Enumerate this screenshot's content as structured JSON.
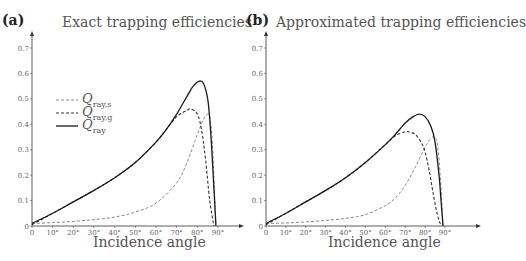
{
  "chart_data": [
    {
      "type": "line",
      "panel_label": "(a)",
      "title": "Exact trapping efficiencies",
      "xlabel": "Incidence angle",
      "ylabel": "",
      "xlim": [
        0,
        90
      ],
      "ylim": [
        0,
        0.7
      ],
      "x_ticks": [
        "0",
        "10°",
        "20°",
        "30°",
        "40°",
        "50°",
        "60°",
        "70°",
        "80°",
        "90°"
      ],
      "y_ticks": [
        "0",
        "0.1",
        "0.2",
        "0.3",
        "0.4",
        "0.5",
        "0.6",
        "0.7"
      ],
      "grid": false,
      "legend_position": "upper-left",
      "series": [
        {
          "name": "Q_ray,s",
          "style": "dashed-light",
          "x": [
            0,
            10,
            20,
            30,
            40,
            50,
            60,
            70,
            75,
            80,
            83,
            85,
            86,
            87,
            88,
            89
          ],
          "y": [
            0.01,
            0.013,
            0.018,
            0.025,
            0.035,
            0.055,
            0.09,
            0.17,
            0.25,
            0.36,
            0.42,
            0.44,
            0.43,
            0.36,
            0.2,
            0.0
          ]
        },
        {
          "name": "Q_ray,g",
          "style": "dashed-dark",
          "x": [
            0,
            10,
            20,
            30,
            40,
            50,
            60,
            65,
            70,
            75,
            77,
            80,
            82,
            84,
            86,
            88
          ],
          "y": [
            0.005,
            0.05,
            0.095,
            0.14,
            0.19,
            0.25,
            0.33,
            0.38,
            0.43,
            0.455,
            0.46,
            0.44,
            0.38,
            0.26,
            0.1,
            0.0
          ]
        },
        {
          "name": "Q_ray",
          "style": "solid",
          "x": [
            0,
            10,
            20,
            30,
            40,
            50,
            60,
            65,
            70,
            75,
            78,
            81,
            83,
            85,
            86,
            87,
            88,
            89
          ],
          "y": [
            0.01,
            0.05,
            0.095,
            0.14,
            0.19,
            0.25,
            0.33,
            0.38,
            0.44,
            0.51,
            0.55,
            0.57,
            0.56,
            0.5,
            0.42,
            0.3,
            0.15,
            0.0
          ]
        }
      ]
    },
    {
      "type": "line",
      "panel_label": "(b)",
      "title": "Approximated trapping efficiencies",
      "xlabel": "Incidence angle",
      "ylabel": "",
      "xlim": [
        0,
        90
      ],
      "ylim": [
        0,
        0.7
      ],
      "x_ticks": [
        "0",
        "10°",
        "20°",
        "30°",
        "40°",
        "50°",
        "60°",
        "70°",
        "80°",
        "90°"
      ],
      "y_ticks": [
        "0",
        "0.1",
        "0.2",
        "0.3",
        "0.4",
        "0.5",
        "0.6",
        "0.7"
      ],
      "grid": false,
      "series": [
        {
          "name": "Q_ray,s",
          "style": "dashed-light",
          "x": [
            0,
            10,
            20,
            30,
            40,
            50,
            60,
            65,
            70,
            75,
            80,
            83,
            85,
            86,
            87,
            88,
            89
          ],
          "y": [
            0.01,
            0.012,
            0.016,
            0.022,
            0.03,
            0.045,
            0.08,
            0.11,
            0.16,
            0.23,
            0.31,
            0.345,
            0.35,
            0.33,
            0.26,
            0.15,
            0.0
          ]
        },
        {
          "name": "Q_ray,g",
          "style": "dashed-dark",
          "x": [
            0,
            10,
            20,
            30,
            40,
            50,
            60,
            65,
            70,
            72,
            75,
            78,
            80,
            82,
            84,
            86,
            88
          ],
          "y": [
            0.005,
            0.05,
            0.095,
            0.14,
            0.19,
            0.25,
            0.32,
            0.355,
            0.37,
            0.37,
            0.36,
            0.33,
            0.29,
            0.22,
            0.13,
            0.05,
            0.0
          ]
        },
        {
          "name": "Q_ray",
          "style": "solid",
          "x": [
            0,
            10,
            20,
            30,
            40,
            50,
            60,
            65,
            70,
            74,
            77,
            80,
            83,
            85,
            87,
            88,
            89
          ],
          "y": [
            0.01,
            0.05,
            0.095,
            0.14,
            0.19,
            0.25,
            0.32,
            0.36,
            0.405,
            0.43,
            0.44,
            0.43,
            0.39,
            0.33,
            0.2,
            0.1,
            0.0
          ]
        }
      ]
    }
  ],
  "panels": [
    {
      "label": "(a)",
      "title": "Exact trapping efficiencies",
      "xlabel": "Incidence angle"
    },
    {
      "label": "(b)",
      "title": "Approximated trapping efficiencies",
      "xlabel": "Incidence angle"
    }
  ],
  "legend": [
    {
      "symbol": "Q",
      "subscript": "ray,s"
    },
    {
      "symbol": "Q",
      "subscript": "ray,g"
    },
    {
      "symbol": "Q",
      "subscript": "ray"
    }
  ],
  "colors": {
    "axis": "#333333",
    "solid": "#1a1a1a",
    "dashed_dark": "#333333",
    "dashed_light": "#888888",
    "tick_text": "#666666"
  }
}
